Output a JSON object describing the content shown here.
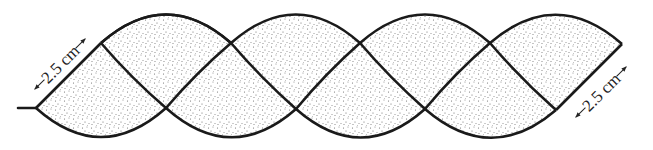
{
  "figure": {
    "labels": {
      "left_dimension": "2.5 cm",
      "right_dimension": "2.5 cm"
    },
    "colors": {
      "outline": "#1a1a1a",
      "fill_dots": "#555555",
      "background": "#ffffff"
    }
  }
}
